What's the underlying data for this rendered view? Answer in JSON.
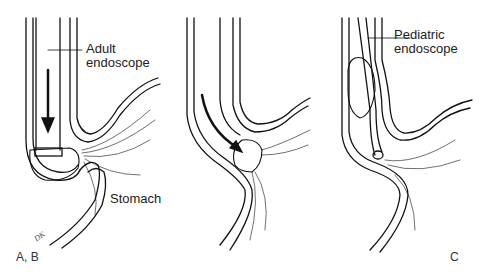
{
  "figure": {
    "panels": [
      {
        "id": "A-B",
        "label": "A, B",
        "callouts": [
          "Adult endoscope",
          "Stomach"
        ]
      },
      {
        "id": "B-middle",
        "label": "",
        "callouts": []
      },
      {
        "id": "C",
        "label": "C",
        "callouts": [
          "Pediatric endoscope"
        ]
      }
    ],
    "labels": {
      "adult_line1": "Adult",
      "adult_line2": "endoscope",
      "stomach": "Stomach",
      "pediatric_line1": "Pediatric",
      "pediatric_line2": "endoscope",
      "panel_ab": "A, B",
      "panel_c": "C",
      "signature": "DK"
    },
    "colors": {
      "ink": "#111111",
      "background": "#ffffff"
    }
  }
}
